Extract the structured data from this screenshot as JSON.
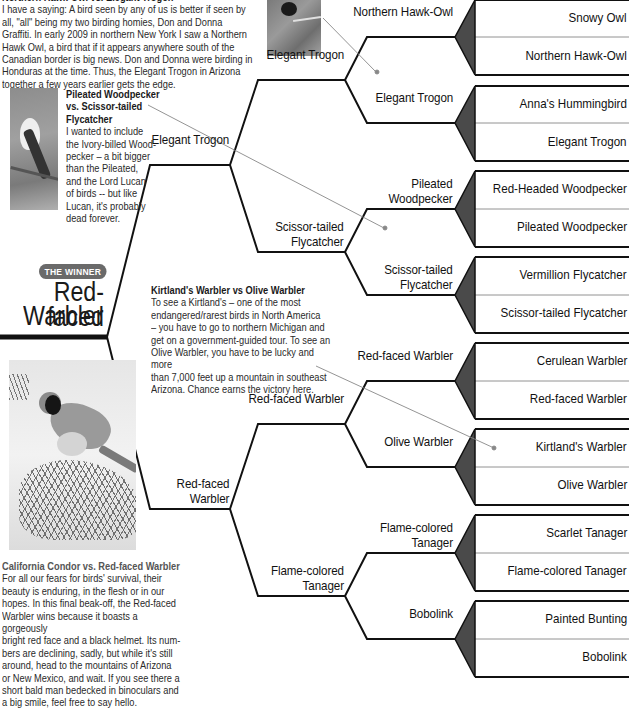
{
  "notes": {
    "top": {
      "title": "Northern Hawk-Owl vs. Elegant Trogon",
      "body": "I have a saying: A bird seen by any of us is better if seen by all, \"all\" being my two birding homies, Don and Donna Graffiti. In early 2009 in northern New York I saw a Northern Hawk Owl, a bird that if it appears anywhere south of the Canadian border is big news. Don and Donna were birding in Honduras at the time. Thus, the Elegant Trogon in Arizona together a few years earlier gets the edge."
    },
    "pileated": {
      "title_lines": [
        "Pileated Woodpecker",
        "vs. Scissor-tailed",
        "Flycatcher"
      ],
      "body_lines": [
        "I wanted to include",
        "the Ivory-billed Wood-",
        "pecker – a bit bigger",
        "than the Pileated,",
        "and the Lord Lucan",
        "of birds -- but like",
        "Lucan, it's probably",
        "dead forever."
      ]
    },
    "kirtland": {
      "title": "Kirtland's Warbler vs Olive Warbler",
      "body_lines": [
        "To see a Kirtland's – one of the most",
        "endangered/rarest birds in North America",
        "– you have to go to northern Michigan and",
        "get on a government-guided tour. To see an",
        "Olive Warbler, you have to be lucky and more",
        "than 7,000 feet up a mountain in southeast",
        "Arizona. Chance earns the victory here."
      ]
    },
    "condor": {
      "title": "California Condor vs. Red-faced Warbler",
      "body_lines": [
        "For all our fears for birds' survival, their",
        "beauty is enduring, in the flesh or in our",
        "hopes. In this final beak-off, the Red-faced",
        "Warbler wins because it boasts a gorgeously",
        "bright red face and a black helmet. Its num-",
        "bers are declining, sadly, but while it's still",
        "around, head to the mountains of Arizona",
        "or New Mexico, and wait. If you see there a",
        "short bald man bedecked in binoculars and",
        "a big smile, feel free to say hello."
      ]
    }
  },
  "winner": {
    "badge": "THE WINNER",
    "line1": "Red-faced",
    "line2": "Warbler"
  },
  "bracket": {
    "round1": [
      "Snowy Owl",
      "Northern Hawk-Owl",
      "Anna's Hummingbird",
      "Elegant Trogon",
      "Red-Headed Woodpecker",
      "Pileated Woodpecker",
      "Vermillion Flycatcher",
      "Scissor-tailed Flycatcher",
      "Cerulean Warbler",
      "Red-faced Warbler",
      "Kirtland's Warbler",
      "Olive Warbler",
      "Scarlet Tanager",
      "Flame-colored Tanager",
      "Painted Bunting",
      "Bobolink"
    ],
    "round2": [
      {
        "l1": "",
        "l2": "Northern Hawk-Owl"
      },
      {
        "l1": "",
        "l2": "Elegant Trogon"
      },
      {
        "l1": "Pileated",
        "l2": "Woodpecker"
      },
      {
        "l1": "Scissor-tailed",
        "l2": "Flycatcher"
      },
      {
        "l1": "",
        "l2": "Red-faced Warbler"
      },
      {
        "l1": "",
        "l2": "Olive Warbler"
      },
      {
        "l1": "Flame-colored",
        "l2": "Tanager"
      },
      {
        "l1": "",
        "l2": "Bobolink"
      }
    ],
    "round3": [
      {
        "l1": "",
        "l2": "Elegant Trogon"
      },
      {
        "l1": "Scissor-tailed",
        "l2": "Flycatcher"
      },
      {
        "l1": "",
        "l2": "Red-faced Warbler"
      },
      {
        "l1": "Flame-colored",
        "l2": "Tanager"
      }
    ],
    "round4": [
      {
        "l1": "",
        "l2": "Elegant Trogon"
      },
      {
        "l1": "Red-faced",
        "l2": "Warbler"
      }
    ]
  }
}
